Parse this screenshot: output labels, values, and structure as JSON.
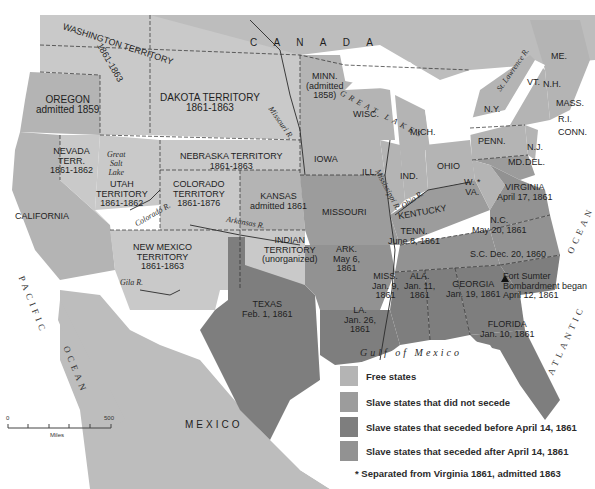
{
  "colors": {
    "free": "#b4b4b4",
    "slave_not_secede": "#9c9c9c",
    "seceded_before": "#7e7e7e",
    "seceded_after": "#929292",
    "territory": "#c9c9c9",
    "foreign": "#bdbdbd",
    "water": "#ffffff",
    "border": "#2a2a2a"
  },
  "regions": {
    "canada": "C A N A D A",
    "mexico": "MEXICO",
    "great_lakes": "GREAT LAKES",
    "gulf": "Gulf of Mexico",
    "pacific": "PACIFIC",
    "pacific_ocean": "OCEAN",
    "atlantic": "ATLANTIC",
    "atlantic_ocean": "OCEAN"
  },
  "rivers": {
    "missouri": "Missouri R.",
    "mississippi": "Mississippi R.",
    "ohio": "Ohio R.",
    "colorado": "Colorado R.",
    "arkansas": "Arkansas R.",
    "gila": "Gila R.",
    "st_lawrence": "St. Lawrence R.",
    "great_salt_lake": [
      "Great",
      "Salt",
      "Lake"
    ]
  },
  "states": {
    "washington": {
      "name": "WASHINGTON TERRITORY",
      "date": "1861-1863"
    },
    "oregon": {
      "name": "OREGON",
      "date": "admitted 1859"
    },
    "dakota": {
      "name": "DAKOTA TERRITORY",
      "date": "1861-1863"
    },
    "minnesota": {
      "name": "MINN.",
      "date1": "(admitted",
      "date2": "1858)"
    },
    "wisconsin": {
      "name": "WISC."
    },
    "michigan": {
      "name": "MICH."
    },
    "newyork": {
      "name": "N.Y."
    },
    "maine": {
      "name": "ME."
    },
    "vermont": {
      "name": "VT."
    },
    "nh": {
      "name": "N.H."
    },
    "mass": {
      "name": "MASS."
    },
    "ri": {
      "name": "R.I."
    },
    "conn": {
      "name": "CONN."
    },
    "nevada": {
      "name1": "NEVADA",
      "name2": "TERR.",
      "date": "1861-1862"
    },
    "utah": {
      "name1": "UTAH",
      "name2": "TERRITORY",
      "date": "1861-1862"
    },
    "nebraska": {
      "name": "NEBRASKA TERRITORY",
      "date": "1861-1863"
    },
    "iowa": {
      "name": "IOWA"
    },
    "illinois": {
      "name": "ILL."
    },
    "indiana": {
      "name": "IND."
    },
    "ohio": {
      "name": "OHIO"
    },
    "penn": {
      "name": "PENN."
    },
    "nj": {
      "name": "N.J."
    },
    "md": {
      "name": "MD."
    },
    "del": {
      "name": "DEL."
    },
    "california": {
      "name": "CALIFORNIA"
    },
    "colorado": {
      "name1": "COLORADO",
      "name2": "TERRITORY",
      "date": "1861-1876"
    },
    "kansas": {
      "name": "KANSAS",
      "date": "admitted 1861"
    },
    "missouri": {
      "name": "MISSOURI"
    },
    "kentucky": {
      "name": "KENTUCKY"
    },
    "wva": {
      "name1": "W.",
      "name2": "VA.",
      "mark": "*"
    },
    "virginia": {
      "name": "VIRGINIA",
      "date": "April 17, 1861"
    },
    "nc": {
      "name": "N.C.",
      "date": "May 20, 1861"
    },
    "tenn": {
      "name": "TENN.",
      "date": "June 8, 1861"
    },
    "sc": {
      "name": "S.C. Dec. 20, 1860"
    },
    "newmexico": {
      "name1": "NEW MEXICO",
      "name2": "TERRITORY",
      "date": "1861-1863"
    },
    "indian": {
      "name1": "INDIAN",
      "name2": "TERRITORY",
      "note": "(unorganized)"
    },
    "ark": {
      "name": "ARK.",
      "date1": "May 6,",
      "date2": "1861"
    },
    "miss": {
      "name": "MISS.",
      "date1": "Jan. 9,",
      "date2": "1861"
    },
    "ala": {
      "name": "ALA.",
      "date1": "Jan. 11,",
      "date2": "1861"
    },
    "georgia": {
      "name": "GEORGIA",
      "date": "Jan. 19, 1861"
    },
    "texas": {
      "name": "TEXAS",
      "date": "Feb. 1, 1861"
    },
    "la": {
      "name": "LA.",
      "date1": "Jan. 26,",
      "date2": "1861"
    },
    "florida": {
      "name": "FLORIDA",
      "date": "Jan. 10, 1861"
    }
  },
  "fort_sumter": {
    "line1": "Fort Sumter",
    "line2": "Bombardment began",
    "line3": "April 12, 1861"
  },
  "legend": [
    {
      "label": "Free states",
      "key": "free"
    },
    {
      "label": "Slave states that did not secede",
      "key": "slave_not_secede"
    },
    {
      "label": "Slave states that seceded before April 14, 1861",
      "key": "seceded_before"
    },
    {
      "label": "Slave states that seceded after April 14, 1861",
      "key": "seceded_after"
    }
  ],
  "footnote": "* Separated from Virginia 1861, admitted 1863",
  "scale": {
    "min": "0",
    "max": "500",
    "unit": "Miles"
  }
}
